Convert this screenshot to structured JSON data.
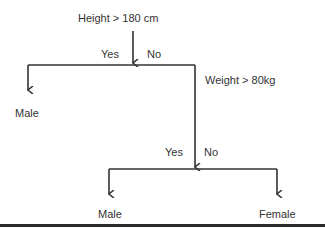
{
  "tree": {
    "root": {
      "label": "Height > 180 cm",
      "yes": "Yes",
      "no": "No"
    },
    "leaf_top_left": {
      "label": "Male"
    },
    "node2": {
      "label": "Weight > 80kg",
      "yes": "Yes",
      "no": "No"
    },
    "leaf_bottom_left": {
      "label": "Male"
    },
    "leaf_bottom_right": {
      "label": "Female"
    }
  },
  "colors": {
    "line": "#333333",
    "text": "#333333"
  }
}
